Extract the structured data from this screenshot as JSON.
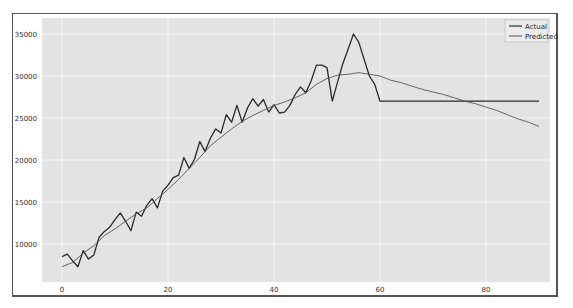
{
  "chart_data": {
    "type": "line",
    "title": "",
    "xlabel": "",
    "ylabel": "",
    "xlim": [
      -3,
      93
    ],
    "ylim": [
      5000,
      36500
    ],
    "grid": true,
    "legend_position": "upper right",
    "x_ticks": [
      0,
      20,
      40,
      60,
      80
    ],
    "y_ticks": [
      10000,
      15000,
      20000,
      25000,
      30000,
      35000
    ],
    "x_tick_labels": [
      "0",
      "20",
      "40",
      "60",
      "80"
    ],
    "y_tick_labels": [
      "10000",
      "15000",
      "20000",
      "25000",
      "30000",
      "35000"
    ],
    "series": [
      {
        "name": "Actual",
        "color": "#2a2a2a",
        "x": [
          0,
          1,
          2,
          3,
          4,
          5,
          6,
          7,
          8,
          9,
          10,
          11,
          12,
          13,
          14,
          15,
          16,
          17,
          18,
          19,
          20,
          21,
          22,
          23,
          24,
          25,
          26,
          27,
          28,
          29,
          30,
          31,
          32,
          33,
          34,
          35,
          36,
          37,
          38,
          39,
          40,
          41,
          42,
          43,
          44,
          45,
          46,
          47,
          48,
          49,
          50,
          51,
          52,
          53,
          54,
          55,
          56,
          57,
          58,
          59,
          60,
          61,
          62,
          63,
          64,
          65,
          66,
          67,
          68,
          69,
          70,
          71,
          72,
          73,
          74,
          75,
          76,
          77,
          78,
          79,
          80,
          81,
          82,
          83,
          84,
          85,
          86,
          87,
          88,
          89,
          90
        ],
        "values": [
          8500,
          8800,
          8000,
          7300,
          9200,
          8200,
          8700,
          10800,
          11500,
          12000,
          12900,
          13700,
          12700,
          11600,
          13800,
          13300,
          14600,
          15400,
          14300,
          16300,
          17000,
          17900,
          18200,
          20300,
          19000,
          20100,
          22200,
          21000,
          22600,
          23700,
          23200,
          25400,
          24500,
          26500,
          24500,
          26200,
          27300,
          26400,
          27200,
          25700,
          26600,
          25600,
          25700,
          26500,
          27800,
          28700,
          28000,
          29400,
          31300,
          31300,
          31000,
          27000,
          29300,
          31500,
          33200,
          35000,
          34000,
          32000,
          30000,
          29000,
          27000,
          27000,
          27000,
          27000,
          27000,
          27000,
          27000,
          27000,
          27000,
          27000,
          27000,
          27000,
          27000,
          27000,
          27000,
          27000,
          27000,
          27000,
          27000,
          27000,
          27000,
          27000,
          27000,
          27000,
          27000,
          27000,
          27000,
          27000,
          27000,
          27000,
          27000
        ]
      },
      {
        "name": "Predicted",
        "color": "#555555",
        "x": [
          0,
          2,
          4,
          6,
          8,
          10,
          12,
          14,
          16,
          18,
          20,
          22,
          24,
          26,
          28,
          30,
          32,
          34,
          36,
          38,
          40,
          42,
          44,
          46,
          48,
          50,
          52,
          54,
          56,
          58,
          60,
          62,
          64,
          66,
          68,
          70,
          72,
          74,
          76,
          78,
          80,
          82,
          84,
          86,
          88,
          90
        ],
        "values": [
          7300,
          7800,
          8900,
          9800,
          11000,
          11800,
          12700,
          13600,
          14300,
          15400,
          16500,
          17700,
          19000,
          20300,
          21700,
          22700,
          23700,
          24600,
          25300,
          25900,
          26500,
          26900,
          27400,
          28000,
          29000,
          29700,
          30100,
          30200,
          30400,
          30200,
          30000,
          29500,
          29200,
          28800,
          28400,
          28100,
          27800,
          27400,
          27000,
          26700,
          26300,
          25900,
          25400,
          24900,
          24500,
          24000
        ]
      }
    ]
  },
  "legend": {
    "items": [
      {
        "label": "Actual",
        "color": "#2a2a2a"
      },
      {
        "label": "Predicted",
        "color": "#555555"
      }
    ]
  }
}
